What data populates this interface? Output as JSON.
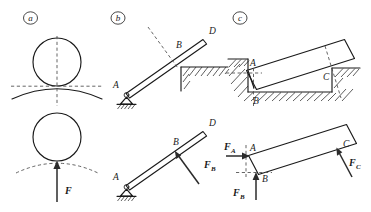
{
  "figure": {
    "background_color": "#ffffff",
    "ink_color": "#1a1a1a",
    "dash_color": "#4a4a4a",
    "width": 371,
    "height": 212
  },
  "panels": [
    {
      "id": "a",
      "letter": "a",
      "description": "Sphere resting on a curved surface; upper view shows contact with common tangent and normal, lower view shows the free body with normal force F.",
      "labels": [
        {
          "name": "force-F",
          "text": "F",
          "style": "bold-italic"
        }
      ],
      "elements": [
        {
          "name": "upper-sphere",
          "kind": "circle"
        },
        {
          "name": "curved-support-surface",
          "kind": "arc"
        },
        {
          "name": "tangent-dashed-line",
          "kind": "dashed-horizontal"
        },
        {
          "name": "normal-dashed-line",
          "kind": "dashed-vertical"
        },
        {
          "name": "lower-sphere",
          "kind": "circle"
        },
        {
          "name": "removed-surface-dashed-arc",
          "kind": "dashed-arc"
        },
        {
          "name": "normal-force-arrow",
          "kind": "arrow-up"
        }
      ]
    },
    {
      "id": "b",
      "letter": "b",
      "description": "Rod AD pinned at A and resting on a corner edge at B; lower view is the free body with the normal reaction F_B perpendicular to the rod.",
      "labels": [
        {
          "name": "point-A-upper",
          "text": "A",
          "style": "italic"
        },
        {
          "name": "point-B-upper",
          "text": "B",
          "style": "italic"
        },
        {
          "name": "point-D-upper",
          "text": "D",
          "style": "italic"
        },
        {
          "name": "point-A-lower",
          "text": "A",
          "style": "italic"
        },
        {
          "name": "point-B-lower",
          "text": "B",
          "style": "italic"
        },
        {
          "name": "point-D-lower",
          "text": "D",
          "style": "italic"
        },
        {
          "name": "force-FB",
          "text": "F",
          "subscript": "B",
          "style": "bold-italic"
        }
      ],
      "elements": [
        {
          "name": "rod-AD-upper",
          "kind": "rod"
        },
        {
          "name": "pin-support-A-upper",
          "kind": "pin-support"
        },
        {
          "name": "ground-hatching-A-upper",
          "kind": "hatching"
        },
        {
          "name": "corner-edge-support-B",
          "kind": "step-corner"
        },
        {
          "name": "corner-hatching-B",
          "kind": "hatching"
        },
        {
          "name": "normal-dashed-line-B",
          "kind": "dashed-normal"
        },
        {
          "name": "rod-AD-lower",
          "kind": "rod"
        },
        {
          "name": "pin-support-A-lower",
          "kind": "pin-support"
        },
        {
          "name": "ground-hatching-A-lower",
          "kind": "hatching"
        },
        {
          "name": "reaction-FB-arrow",
          "kind": "arrow"
        }
      ]
    },
    {
      "id": "c",
      "letter": "c",
      "description": "Rectangular block seated in a rectangular groove touching at corners A, B and C; lower view is the free body with reactions F_A, F_B and F_C.",
      "labels": [
        {
          "name": "point-A-upper",
          "text": "A",
          "style": "italic"
        },
        {
          "name": "point-B-upper",
          "text": "B",
          "style": "italic"
        },
        {
          "name": "point-C-upper",
          "text": "C",
          "style": "italic"
        },
        {
          "name": "point-A-lower",
          "text": "A",
          "style": "italic"
        },
        {
          "name": "point-B-lower",
          "text": "B",
          "style": "italic"
        },
        {
          "name": "point-C-lower",
          "text": "C",
          "style": "italic"
        },
        {
          "name": "force-FA",
          "text": "F",
          "subscript": "A",
          "style": "bold-italic"
        },
        {
          "name": "force-FB",
          "text": "F",
          "subscript": "B",
          "style": "bold-italic"
        },
        {
          "name": "force-FC",
          "text": "F",
          "subscript": "C",
          "style": "bold-italic"
        }
      ],
      "elements": [
        {
          "name": "block-upper",
          "kind": "rectangle-inclined"
        },
        {
          "name": "groove-walls",
          "kind": "slot"
        },
        {
          "name": "groove-hatching",
          "kind": "hatching"
        },
        {
          "name": "normal-dashed-A",
          "kind": "dashed-horizontal"
        },
        {
          "name": "normal-dashed-B",
          "kind": "dashed-vertical"
        },
        {
          "name": "normal-dashed-C",
          "kind": "dashed-inclined"
        },
        {
          "name": "block-lower",
          "kind": "rectangle-inclined"
        },
        {
          "name": "reaction-FA-arrow",
          "kind": "arrow-right"
        },
        {
          "name": "reaction-FB-arrow",
          "kind": "arrow-up"
        },
        {
          "name": "reaction-FC-arrow",
          "kind": "arrow-inclined"
        }
      ]
    }
  ]
}
